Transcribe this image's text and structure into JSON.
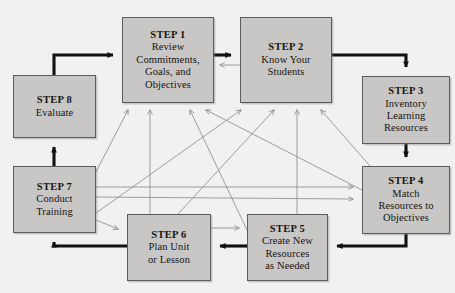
{
  "diagram": {
    "background_color": "#f3f1ef",
    "node_fill_color": "#c9c7c5",
    "node_border_color": "#5d5b59",
    "primary_arrow_color": "#111111",
    "secondary_arrow_color": "#8f8d8b",
    "nodes": [
      {
        "id": "step1",
        "step": "STEP 1",
        "body": "Review\nCommitments,\nGoals, and\nObjectives",
        "x": 122,
        "y": 17,
        "w": 92,
        "h": 86
      },
      {
        "id": "step2",
        "step": "STEP 2",
        "body": "Know Your\nStudents",
        "x": 240,
        "y": 17,
        "w": 92,
        "h": 86
      },
      {
        "id": "step3",
        "step": "STEP 3",
        "body": "Inventory\nLearning\nResources",
        "x": 362,
        "y": 76,
        "w": 88,
        "h": 68
      },
      {
        "id": "step4",
        "step": "STEP 4",
        "body": "Match\nResources to\nObjectives",
        "x": 362,
        "y": 166,
        "w": 88,
        "h": 68
      },
      {
        "id": "step5",
        "step": "STEP 5",
        "body": "Create New\nResources\nas Needed",
        "x": 247,
        "y": 214,
        "w": 81,
        "h": 67
      },
      {
        "id": "step6",
        "step": "STEP 6",
        "body": "Plan Unit\nor Lesson",
        "x": 127,
        "y": 214,
        "w": 84,
        "h": 67
      },
      {
        "id": "step7",
        "step": "STEP 7",
        "body": "Conduct\nTraining",
        "x": 13,
        "y": 166,
        "w": 83,
        "h": 67
      },
      {
        "id": "step8",
        "step": "STEP 8",
        "body": "Evaluate",
        "x": 13,
        "y": 75,
        "w": 83,
        "h": 63
      }
    ],
    "main_flow": [
      {
        "from": "step8",
        "to": "step1",
        "style": "thick"
      },
      {
        "from": "step1",
        "to": "step2",
        "style": "thick"
      },
      {
        "from": "step2",
        "to": "step3",
        "style": "thick"
      },
      {
        "from": "step3",
        "to": "step4",
        "style": "thick"
      },
      {
        "from": "step4",
        "to": "step5",
        "style": "thick"
      },
      {
        "from": "step5",
        "to": "step6",
        "style": "thick"
      },
      {
        "from": "step6",
        "to": "step7",
        "style": "thick"
      },
      {
        "from": "step7",
        "to": "step8",
        "style": "thick"
      }
    ],
    "feedback_links": [
      {
        "from": "step2",
        "to": "step1",
        "style": "thin"
      },
      {
        "from": "step7",
        "to": "step1",
        "style": "thin"
      },
      {
        "from": "step6",
        "to": "step1",
        "style": "thin"
      },
      {
        "from": "step5",
        "to": "step1",
        "style": "thin"
      },
      {
        "from": "step4",
        "to": "step1",
        "style": "thin"
      },
      {
        "from": "step7",
        "to": "step2",
        "style": "thin"
      },
      {
        "from": "step6",
        "to": "step2",
        "style": "thin"
      },
      {
        "from": "step5",
        "to": "step2",
        "style": "thin"
      },
      {
        "from": "step4",
        "to": "step2",
        "style": "thin"
      },
      {
        "from": "step7",
        "to": "step4",
        "style": "thin"
      },
      {
        "from": "step6",
        "to": "step4",
        "style": "thin"
      },
      {
        "from": "step7",
        "to": "step6",
        "style": "thin"
      },
      {
        "from": "step6",
        "to": "step5",
        "style": "thin"
      }
    ]
  }
}
